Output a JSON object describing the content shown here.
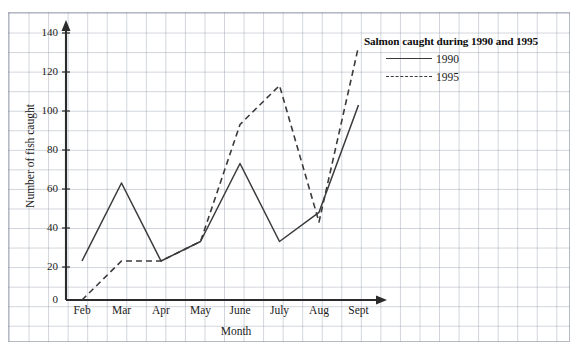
{
  "chart_data": {
    "type": "line",
    "title": "Salmon caught during 1990 and 1995",
    "xlabel": "Month",
    "ylabel": "Number of fish caught",
    "categories": [
      "Feb",
      "Mar",
      "Apr",
      "May",
      "June",
      "July",
      "Aug",
      "Sept"
    ],
    "series": [
      {
        "name": "1990",
        "style": "solid",
        "values": [
          20,
          60,
          20,
          30,
          70,
          30,
          45,
          100
        ]
      },
      {
        "name": "1995",
        "style": "dashed",
        "values": [
          0,
          20,
          20,
          30,
          90,
          110,
          40,
          130
        ]
      }
    ],
    "ylim": [
      0,
      140
    ],
    "yticks": [
      0,
      20,
      40,
      60,
      80,
      100,
      120,
      140
    ],
    "grid": true,
    "legend_position": "top-right",
    "line_color": "#3a3a3a",
    "axis_color": "#2b2b2b",
    "grid_color": "#8c96a5"
  },
  "legend": {
    "title": "Salmon caught during 1990 and 1995",
    "entries": [
      {
        "label": "1990"
      },
      {
        "label": "1995"
      }
    ]
  },
  "axes": {
    "y_title": "Number of fish caught",
    "x_title": "Month"
  }
}
